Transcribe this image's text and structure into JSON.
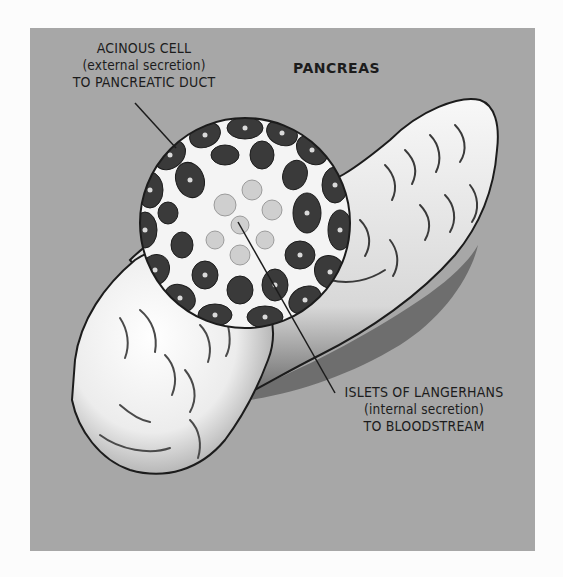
{
  "diagram": {
    "title": "PANCREAS",
    "labels": {
      "acinous": {
        "lines": [
          "ACINOUS CELL",
          "(external secretion)",
          "TO PANCREATIC DUCT"
        ]
      },
      "islets": {
        "lines": [
          "ISLETS OF LANGERHANS",
          "(internal secretion)",
          "TO BLOODSTREAM"
        ]
      }
    },
    "colors": {
      "page_background": "#fcfcfc",
      "panel_background": "#a7a7a7",
      "organ_fill": "#f2f2f2",
      "cell_dark": "#3a3a3a",
      "outline": "#1c1c1c"
    }
  }
}
